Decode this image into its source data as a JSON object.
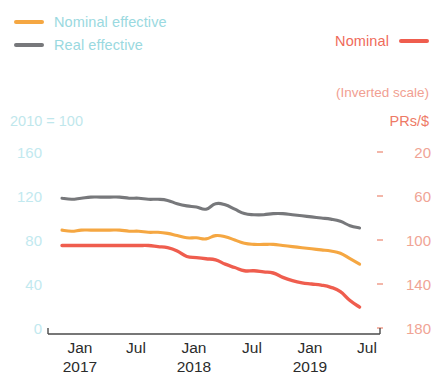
{
  "legend": {
    "left_items": [
      {
        "label": "Nominal effective",
        "color": "#f5a742",
        "name": "nominal-effective"
      },
      {
        "label": "Real effective",
        "color": "#77787b",
        "name": "real-effective"
      }
    ],
    "right_item": {
      "label": "Nominal",
      "color": "#ef5d4e",
      "name": "nominal"
    },
    "text_color": "#9ad9e0"
  },
  "axes": {
    "left_unit": "2010 = 100",
    "right_note": "(Inverted scale)",
    "right_unit": "PRs/$",
    "left_ticks": [
      "160",
      "120",
      "80",
      "40",
      "0"
    ],
    "right_ticks": [
      "20",
      "60",
      "100",
      "140",
      "180"
    ],
    "x_ticks": [
      {
        "month": "Jan",
        "year": "2017"
      },
      {
        "month": "Jul",
        "year": ""
      },
      {
        "month": "Jan",
        "year": "2018"
      },
      {
        "month": "Jul",
        "year": ""
      },
      {
        "month": "Jan",
        "year": "2019"
      },
      {
        "month": "Jul",
        "year": ""
      }
    ]
  },
  "chart_data": {
    "type": "line",
    "title": "",
    "subtitle": "",
    "xlabel": "",
    "ylabel": "2010 = 100",
    "ylabel_right": "PRs/$",
    "ylim": [
      0,
      160
    ],
    "ylim_right": [
      180,
      20
    ],
    "right_axis_inverted": true,
    "grid": false,
    "legend_position": "top",
    "x": [
      "2017-01",
      "2017-02",
      "2017-03",
      "2017-04",
      "2017-05",
      "2017-06",
      "2017-07",
      "2017-08",
      "2017-09",
      "2017-10",
      "2017-11",
      "2017-12",
      "2018-01",
      "2018-02",
      "2018-03",
      "2018-04",
      "2018-05",
      "2018-06",
      "2018-07",
      "2018-08",
      "2018-09",
      "2018-10",
      "2018-11",
      "2018-12",
      "2019-01",
      "2019-02",
      "2019-03",
      "2019-04",
      "2019-05",
      "2019-06",
      "2019-07",
      "2019-08"
    ],
    "series": [
      {
        "name": "Real effective",
        "color": "#77787b",
        "axis": "left",
        "unit": "2010 = 100",
        "values": [
          118,
          117,
          118,
          119,
          119,
          119,
          119,
          118,
          118,
          117,
          117,
          116,
          113,
          111,
          110,
          108,
          113,
          112,
          108,
          104,
          103,
          103,
          104,
          104,
          103,
          102,
          101,
          100,
          99,
          97,
          93,
          91
        ]
      },
      {
        "name": "Nominal effective",
        "color": "#f5a742",
        "axis": "left",
        "unit": "2010 = 100",
        "values": [
          89,
          88,
          89,
          89,
          89,
          89,
          89,
          88,
          88,
          87,
          87,
          86,
          84,
          82,
          82,
          81,
          84,
          83,
          80,
          77,
          76,
          76,
          76,
          75,
          74,
          73,
          72,
          71,
          70,
          68,
          63,
          58
        ]
      },
      {
        "name": "Nominal",
        "color": "#ef5d4e",
        "axis": "right",
        "unit": "PRs/$",
        "values": [
          105,
          105,
          105,
          105,
          105,
          105,
          105,
          105,
          105,
          105,
          106,
          107,
          110,
          115,
          116,
          117,
          118,
          122,
          125,
          128,
          128,
          129,
          130,
          134,
          137,
          139,
          140,
          141,
          143,
          147,
          155,
          161
        ]
      }
    ]
  }
}
